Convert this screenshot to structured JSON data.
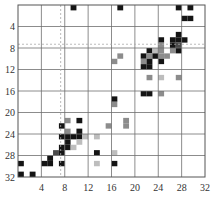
{
  "chart_data": {
    "type": "heatmap",
    "title": "",
    "xlabel": "",
    "ylabel": "",
    "xlim": [
      0,
      32
    ],
    "ylim": [
      0,
      32
    ],
    "y_inverted": true,
    "grid": true,
    "x_ticks": [
      4,
      8,
      12,
      16,
      20,
      24,
      28,
      32
    ],
    "y_ticks": [
      4,
      8,
      12,
      16,
      20,
      24,
      28,
      32
    ],
    "reference_lines": {
      "vertical_dashed_x": 7.3,
      "horizontal_dashed_y": 7.3
    },
    "color_levels": {
      "black": "#141414",
      "dark": "#4a4a4a",
      "mid": "#8c8c8c",
      "light": "#bdbdbd"
    },
    "cells": [
      {
        "x": 9,
        "y": 0,
        "level": "black"
      },
      {
        "x": 17,
        "y": 0,
        "level": "black"
      },
      {
        "x": 27,
        "y": 0,
        "level": "black"
      },
      {
        "x": 29,
        "y": 0,
        "level": "black"
      },
      {
        "x": 28,
        "y": 2,
        "level": "black"
      },
      {
        "x": 29,
        "y": 2,
        "level": "black"
      },
      {
        "x": 27,
        "y": 5,
        "level": "black"
      },
      {
        "x": 24,
        "y": 6,
        "level": "black"
      },
      {
        "x": 26,
        "y": 6,
        "level": "black"
      },
      {
        "x": 27,
        "y": 6,
        "level": "black"
      },
      {
        "x": 28,
        "y": 6,
        "level": "black"
      },
      {
        "x": 26,
        "y": 7,
        "level": "black"
      },
      {
        "x": 27,
        "y": 7,
        "level": "dark"
      },
      {
        "x": 24,
        "y": 7,
        "level": "mid"
      },
      {
        "x": 26,
        "y": 8,
        "level": "mid"
      },
      {
        "x": 27,
        "y": 8,
        "level": "black"
      },
      {
        "x": 22,
        "y": 8,
        "level": "black"
      },
      {
        "x": 23,
        "y": 8,
        "level": "light"
      },
      {
        "x": 24,
        "y": 8,
        "level": "mid"
      },
      {
        "x": 21,
        "y": 9,
        "level": "black"
      },
      {
        "x": 22,
        "y": 9,
        "level": "mid"
      },
      {
        "x": 23,
        "y": 9,
        "level": "black"
      },
      {
        "x": 24,
        "y": 9,
        "level": "mid"
      },
      {
        "x": 25,
        "y": 9,
        "level": "mid"
      },
      {
        "x": 17,
        "y": 9,
        "level": "mid"
      },
      {
        "x": 16,
        "y": 10,
        "level": "mid"
      },
      {
        "x": 21,
        "y": 10,
        "level": "mid"
      },
      {
        "x": 22,
        "y": 10,
        "level": "black"
      },
      {
        "x": 24,
        "y": 10,
        "level": "black"
      },
      {
        "x": 21,
        "y": 11,
        "level": "black"
      },
      {
        "x": 22,
        "y": 11,
        "level": "black"
      },
      {
        "x": 22,
        "y": 13,
        "level": "mid"
      },
      {
        "x": 24,
        "y": 13,
        "level": "light"
      },
      {
        "x": 27,
        "y": 13,
        "level": "mid"
      },
      {
        "x": 21,
        "y": 16,
        "level": "black"
      },
      {
        "x": 22,
        "y": 16,
        "level": "black"
      },
      {
        "x": 24,
        "y": 16,
        "level": "mid"
      },
      {
        "x": 16,
        "y": 17,
        "level": "black"
      },
      {
        "x": 16,
        "y": 18,
        "level": "mid"
      },
      {
        "x": 8,
        "y": 21,
        "level": "mid"
      },
      {
        "x": 10,
        "y": 21,
        "level": "black"
      },
      {
        "x": 18,
        "y": 21,
        "level": "mid"
      },
      {
        "x": 7,
        "y": 22,
        "level": "black"
      },
      {
        "x": 15,
        "y": 22,
        "level": "mid"
      },
      {
        "x": 18,
        "y": 22,
        "level": "mid"
      },
      {
        "x": 8,
        "y": 23,
        "level": "mid"
      },
      {
        "x": 10,
        "y": 23,
        "level": "black"
      },
      {
        "x": 7,
        "y": 24,
        "level": "black"
      },
      {
        "x": 8,
        "y": 24,
        "level": "black"
      },
      {
        "x": 9,
        "y": 24,
        "level": "black"
      },
      {
        "x": 10,
        "y": 24,
        "level": "black"
      },
      {
        "x": 11,
        "y": 24,
        "level": "light"
      },
      {
        "x": 13,
        "y": 24,
        "level": "light"
      },
      {
        "x": 8,
        "y": 25,
        "level": "black"
      },
      {
        "x": 10,
        "y": 25,
        "level": "light"
      },
      {
        "x": 7,
        "y": 26,
        "level": "black"
      },
      {
        "x": 8,
        "y": 26,
        "level": "black"
      },
      {
        "x": 9,
        "y": 26,
        "level": "light"
      },
      {
        "x": 6,
        "y": 27,
        "level": "dark"
      },
      {
        "x": 7,
        "y": 27,
        "level": "black"
      },
      {
        "x": 13,
        "y": 27,
        "level": "black"
      },
      {
        "x": 16,
        "y": 27,
        "level": "light"
      },
      {
        "x": 5,
        "y": 28,
        "level": "black"
      },
      {
        "x": 4,
        "y": 29,
        "level": "black"
      },
      {
        "x": 5,
        "y": 29,
        "level": "black"
      },
      {
        "x": 7,
        "y": 29,
        "level": "black"
      },
      {
        "x": 13,
        "y": 29,
        "level": "light"
      },
      {
        "x": 16,
        "y": 29,
        "level": "black"
      },
      {
        "x": 0,
        "y": 29,
        "level": "black"
      },
      {
        "x": 0,
        "y": 31,
        "level": "black"
      },
      {
        "x": 2,
        "y": 31,
        "level": "black"
      }
    ]
  }
}
